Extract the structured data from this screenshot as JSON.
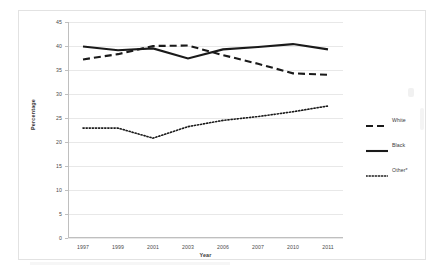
{
  "figure": {
    "background_color": "#ffffff",
    "frame_color": "#e2e2e2"
  },
  "axes": {
    "y_title": "Percentage",
    "x_title": "Year"
  },
  "legend": {
    "position": "right",
    "entries": [
      {
        "label": "White",
        "style": "dashed",
        "color": "#1a1a1a"
      },
      {
        "label": "Black",
        "style": "solid",
        "color": "#1a1a1a"
      },
      {
        "label": "Other*",
        "style": "dotted",
        "color": "#1a1a1a"
      }
    ]
  },
  "chart_data": {
    "type": "line",
    "title": "",
    "subtitle": "",
    "xlabel": "Year",
    "ylabel": "Percentage",
    "categories": [
      "1997",
      "1999",
      "2001",
      "2003",
      "2006",
      "2007",
      "2010",
      "2011"
    ],
    "ylim": [
      0,
      45
    ],
    "yticks": [
      0,
      5,
      10,
      15,
      20,
      25,
      30,
      35,
      40,
      45
    ],
    "grid": true,
    "legend_position": "right",
    "series": [
      {
        "name": "White",
        "style": "dashed",
        "color": "#1a1a1a",
        "values": [
          37.2,
          38.3,
          40.0,
          40.1,
          38.1,
          36.3,
          34.3,
          34.0
        ]
      },
      {
        "name": "Black",
        "style": "solid",
        "color": "#1a1a1a",
        "values": [
          39.9,
          39.1,
          39.5,
          37.4,
          39.3,
          39.8,
          40.4,
          39.3
        ]
      },
      {
        "name": "Other*",
        "style": "dotted",
        "color": "#1a1a1a",
        "values": [
          22.9,
          22.9,
          20.8,
          23.2,
          24.5,
          25.3,
          26.3,
          27.5
        ]
      }
    ]
  }
}
